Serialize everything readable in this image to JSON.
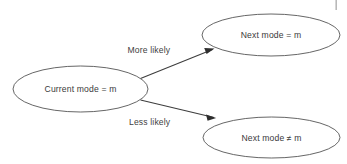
{
  "diagram": {
    "type": "state-transition-diagram",
    "background_color": "#ffffff",
    "stroke_color": "#4a4a4a",
    "text_color": "#3a3a3a",
    "nodes": [
      {
        "id": "current",
        "label": "Current mode = m",
        "shape": "ellipse"
      },
      {
        "id": "same",
        "label": "Next mode = m",
        "shape": "ellipse"
      },
      {
        "id": "different",
        "label": "Next mode ≠ m",
        "shape": "ellipse"
      }
    ],
    "edges": [
      {
        "from": "current",
        "to": "same",
        "label": "More likely",
        "arrow": "arrow-head-icon"
      },
      {
        "from": "current",
        "to": "different",
        "label": "Less likely",
        "arrow": "arrow-head-icon"
      }
    ]
  }
}
